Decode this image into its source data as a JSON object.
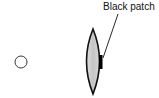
{
  "diagram": {
    "labels": {
      "patch_label": "Black patch"
    },
    "elements": [
      {
        "name": "object-point",
        "shape": "circle"
      },
      {
        "name": "lens",
        "shape": "biconvex-lens"
      },
      {
        "name": "black-patch",
        "shape": "rectangle"
      }
    ],
    "colors": {
      "stroke": "#111111",
      "lens_fill": "#c8c8c8",
      "patch_fill": "#000000",
      "background": "#ffffff"
    }
  }
}
